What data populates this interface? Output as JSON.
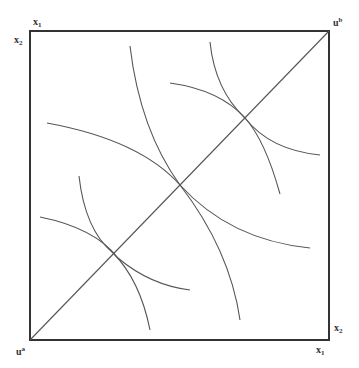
{
  "diagram": {
    "type": "edgeworth-box",
    "labels": {
      "top_left_x": {
        "base": "x",
        "sub": "1"
      },
      "top_left_y": {
        "base": "x",
        "sub": "2"
      },
      "top_right": {
        "base": "u",
        "sup": "b"
      },
      "bottom_left": {
        "base": "u",
        "sup": "a"
      },
      "bottom_right_y": {
        "base": "x",
        "sub": "2"
      },
      "bottom_right_x": {
        "base": "x",
        "sub": "1"
      }
    },
    "box": {
      "x1": 30,
      "y1": 31,
      "x2": 329,
      "y2": 340
    },
    "contract_curve": {
      "from": [
        30,
        340
      ],
      "to": [
        329,
        31
      ]
    },
    "tangency_points": [
      {
        "name": "lower",
        "x": 113,
        "y": 253
      },
      {
        "name": "middle",
        "x": 180,
        "y": 185
      },
      {
        "name": "upper",
        "x": 245,
        "y": 118
      }
    ],
    "indifference_curves": [
      {
        "name": "ua-low-convex",
        "d": "M 40 217 Q 95 228 118 258 Q 150 285 190 290"
      },
      {
        "name": "ub-low-concave",
        "d": "M 79 176 Q 85 230 113 253 Q 140 280 150 330"
      },
      {
        "name": "ua-mid-convex",
        "d": "M 47 123 Q 140 140 180 185 Q 230 240 310 248"
      },
      {
        "name": "ub-mid-concave",
        "d": "M 130 46 Q 140 130 180 185 Q 230 250 240 320"
      },
      {
        "name": "ua-high-convex",
        "d": "M 170 83 Q 220 90 245 118 Q 270 150 320 155"
      },
      {
        "name": "ub-high-concave",
        "d": "M 210 42 Q 215 90 245 118 Q 265 140 280 194"
      }
    ]
  }
}
